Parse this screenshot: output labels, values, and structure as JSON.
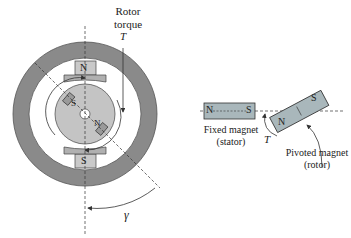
{
  "left_figure": {
    "rotor_torque_label_line1": "Rotor",
    "rotor_torque_label_line2": "torque",
    "torque_symbol": "T",
    "stator_north_label": "N",
    "stator_south_label": "S",
    "rotor_south_label": "S",
    "rotor_north_label": "N",
    "angle_symbol": "γ"
  },
  "right_figure": {
    "fixed_magnet_north": "N",
    "fixed_magnet_south": "S",
    "fixed_magnet_label_line1": "Fixed magnet",
    "fixed_magnet_label_line2": "(stator)",
    "pivoted_magnet_north": "N",
    "pivoted_magnet_south": "S",
    "pivoted_magnet_label_line1": "Pivoted magnet",
    "pivoted_magnet_label_line2": "(rotor)",
    "torque_symbol": "T"
  },
  "colors": {
    "ring": "#8a8a8a",
    "ring_edge": "#555555",
    "rotor_disc": "#c4c4c4",
    "pole_shoe": "#b0b0b0",
    "magnet_fill": "#a9b7bb",
    "stator_magnet_fill": "#c9c9c9"
  }
}
